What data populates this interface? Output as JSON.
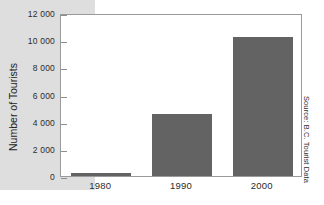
{
  "chart_data": {
    "type": "bar",
    "title": "",
    "xlabel": "",
    "ylabel": "Number of Tourists",
    "categories": [
      "1980",
      "1990",
      "2000"
    ],
    "values": [
      200,
      4600,
      10200
    ],
    "ylim": [
      0,
      12000
    ],
    "yticks": [
      0,
      2000,
      4000,
      6000,
      8000,
      10000,
      12000
    ],
    "ytick_labels": [
      "0",
      "2 000",
      "4 000",
      "6 000",
      "8 000",
      "10 000",
      "12 000"
    ],
    "grid": false,
    "legend": false,
    "series": [
      {
        "name": "Number of Tourists",
        "values": [
          200,
          4600,
          10200
        ]
      }
    ],
    "annotations": {
      "source": "Source: B.C. Tourist Data"
    },
    "colors": {
      "bar": "#636363",
      "plot_background": "#ffffff",
      "figure_band": "#dedede",
      "axis": "#9a9a9a",
      "text": "#2b2b2b"
    }
  }
}
